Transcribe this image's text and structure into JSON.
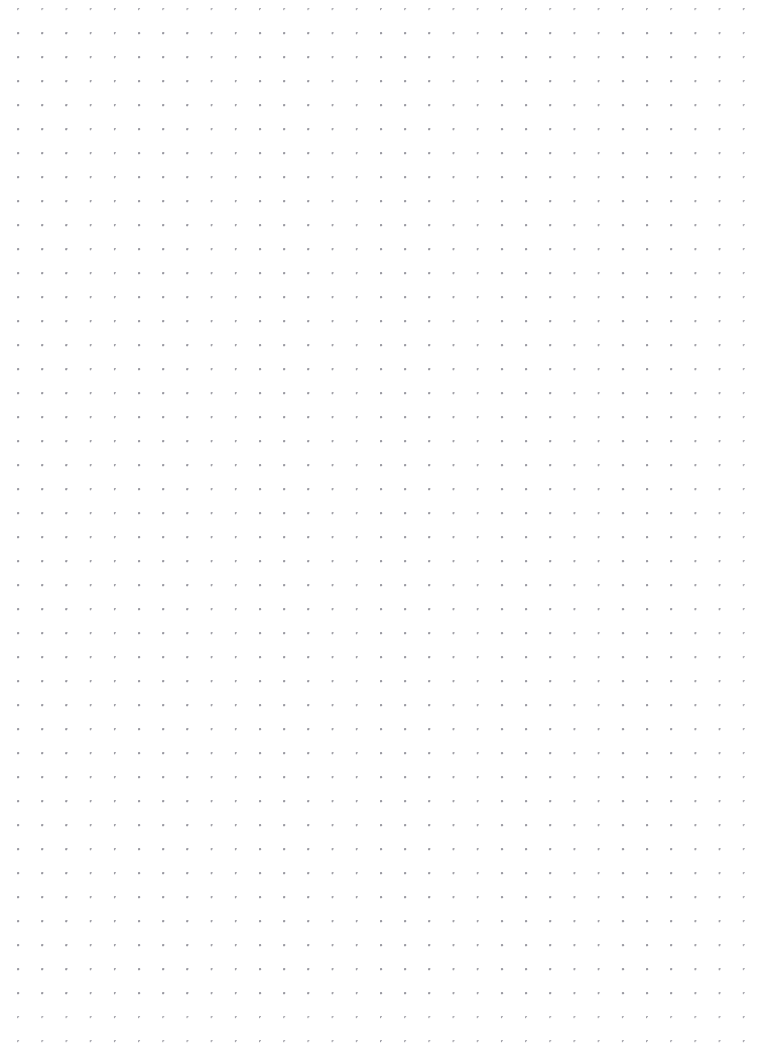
{
  "page": {
    "width": 757,
    "height": 1057,
    "background_color": "#ffffff"
  },
  "grid": {
    "name": "dot-grid",
    "dot_color": "#9a9aa2",
    "dot_diameter_px": 1.6,
    "columns": 30,
    "rows": 41,
    "origin_x": 18,
    "origin_y": 33,
    "spacing_x": 24.2,
    "spacing_y": 24,
    "margin_left": 18,
    "margin_top": 33,
    "margin_right": 38,
    "margin_bottom": 64,
    "total_dots": 1230
  }
}
